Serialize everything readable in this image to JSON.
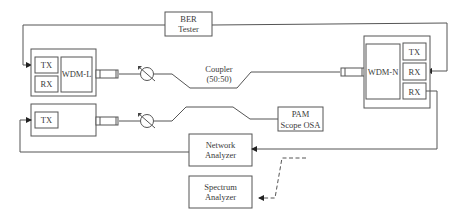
{
  "diagram": {
    "ber_tester": {
      "line1": "BER",
      "line2": "Tester"
    },
    "left_unit_top": {
      "tx": "TX",
      "rx": "RX",
      "wdm": "WDM-L"
    },
    "left_unit_bottom": {
      "tx": "TX"
    },
    "coupler": {
      "line1": "Coupler",
      "line2": "(50:50)"
    },
    "right_unit": {
      "wdm": "WDM-N",
      "tx": "TX",
      "rx1": "RX",
      "rx2": "RX"
    },
    "pam_scope": {
      "line1": "PAM",
      "line2": "Scope OSA"
    },
    "network_analyzer": {
      "line1": "Network",
      "line2": "Analyzer"
    },
    "spectrum_analyzer": {
      "line1": "Spectrum",
      "line2": "Analyzer"
    },
    "colors": {
      "line": "#555555",
      "text": "#3a3a3a",
      "background": "#ffffff"
    }
  }
}
